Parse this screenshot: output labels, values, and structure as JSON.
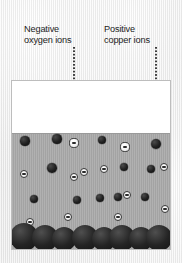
{
  "figure": {
    "background_color": "#e9e9e9"
  },
  "labels": {
    "oxygen": {
      "text": "Negative\noxygen ions",
      "line1": "Negative",
      "line2": "oxygen ions"
    },
    "copper": {
      "text": "Positive\ncopper ions",
      "line1": "Positive",
      "line2": "copper ions"
    }
  },
  "leaders": {
    "oxygen_leader_name": "leader-line-to-oxygen-ion",
    "copper_leader_name": "leader-line-to-copper-ion"
  },
  "container": {
    "border_color": "#bdbdbd",
    "air_color": "#ffffff",
    "liquid_color": "#a8a8a8",
    "deposit_color": "#1e1e1e"
  },
  "legend_colors": {
    "copper_ion": "#1e1e1e",
    "oxygen_ion": "#ffffff",
    "minus_sign": "#2a2a2a"
  },
  "chart_data": {
    "type": "scatter",
    "xlabel": "",
    "ylabel": "",
    "xlim": [
      0,
      160
    ],
    "ylim": [
      0,
      170
    ],
    "grid": false,
    "legend": [
      "Negative oxygen ions",
      "Positive copper ions"
    ],
    "annotations": [
      {
        "text": "Negative oxygen ions",
        "points_to_x": 62,
        "points_to_y": 62
      },
      {
        "text": "Positive copper ions",
        "points_to_x": 144,
        "points_to_y": 63
      }
    ],
    "series": [
      {
        "name": "Positive copper ions",
        "symbol": "filled-dark-circle",
        "color": "#1e1e1e",
        "points": [
          {
            "x": 13,
            "y": 60,
            "r": 4.6
          },
          {
            "x": 45,
            "y": 58,
            "r": 4.6
          },
          {
            "x": 90,
            "y": 59,
            "r": 4.4
          },
          {
            "x": 144,
            "y": 63,
            "r": 5.2
          },
          {
            "x": 40,
            "y": 87,
            "r": 4.8
          },
          {
            "x": 112,
            "y": 86,
            "r": 4.4
          },
          {
            "x": 106,
            "y": 116,
            "r": 4.2
          },
          {
            "x": 139,
            "y": 88,
            "r": 4.4
          },
          {
            "x": 22,
            "y": 118,
            "r": 4.2
          },
          {
            "x": 65,
            "y": 119,
            "r": 4.2
          },
          {
            "x": 88,
            "y": 117,
            "r": 4.4
          },
          {
            "x": 133,
            "y": 116,
            "r": 4.2
          }
        ]
      },
      {
        "name": "Negative oxygen ions",
        "symbol": "white-circle-with-minus",
        "color": "#ffffff",
        "points": [
          {
            "x": 62,
            "y": 62,
            "r": 4.6
          },
          {
            "x": 113,
            "y": 66,
            "r": 4.6
          },
          {
            "x": 12,
            "y": 93,
            "r": 4.4
          },
          {
            "x": 72,
            "y": 91,
            "r": 4.4
          },
          {
            "x": 92,
            "y": 88,
            "r": 4.4
          },
          {
            "x": 152,
            "y": 86,
            "r": 4.4
          },
          {
            "x": 62,
            "y": 96,
            "r": 4.4
          },
          {
            "x": 115,
            "y": 114,
            "r": 4.4
          },
          {
            "x": 56,
            "y": 136,
            "r": 4.4
          },
          {
            "x": 106,
            "y": 136,
            "r": 4.4
          },
          {
            "x": 153,
            "y": 128,
            "r": 4.4
          },
          {
            "x": 18,
            "y": 141,
            "r": 4.2
          }
        ]
      },
      {
        "name": "Copper deposit layer",
        "symbol": "large-overlapping-dark-circles",
        "color": "#1e1e1e",
        "points": [
          {
            "x": 12,
            "y": 158,
            "r": 14
          },
          {
            "x": 33,
            "y": 160,
            "r": 13
          },
          {
            "x": 52,
            "y": 160,
            "r": 12
          },
          {
            "x": 73,
            "y": 159,
            "r": 13
          },
          {
            "x": 92,
            "y": 160,
            "r": 12
          },
          {
            "x": 110,
            "y": 159,
            "r": 13
          },
          {
            "x": 129,
            "y": 160,
            "r": 12
          },
          {
            "x": 147,
            "y": 159,
            "r": 13
          }
        ]
      }
    ]
  }
}
